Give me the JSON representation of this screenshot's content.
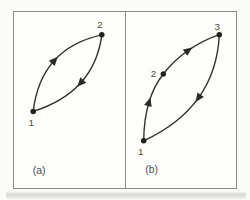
{
  "figure": {
    "panels": [
      {
        "caption": "(a)",
        "nodes": [
          {
            "label": "1"
          },
          {
            "label": "2"
          }
        ],
        "edges": [
          {
            "from": "1",
            "to": "2"
          },
          {
            "from": "2",
            "to": "1"
          }
        ]
      },
      {
        "caption": "(b)",
        "nodes": [
          {
            "label": "1"
          },
          {
            "label": "2"
          },
          {
            "label": "3"
          }
        ],
        "edges": [
          {
            "from": "1",
            "to": "2"
          },
          {
            "from": "2",
            "to": "3"
          },
          {
            "from": "3",
            "to": "1"
          }
        ]
      }
    ],
    "colors": {
      "stroke": "#2f2f2f",
      "label": "#4a4a4a",
      "border": "#8c8c8c",
      "background": "#fefefd"
    }
  }
}
